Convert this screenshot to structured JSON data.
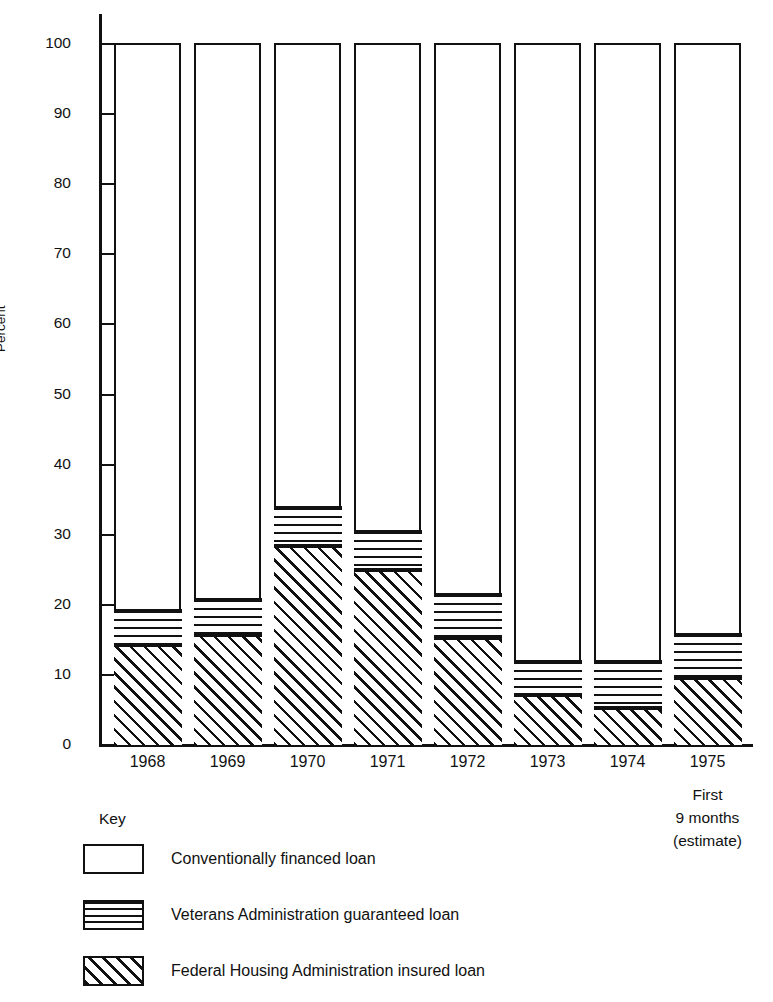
{
  "chart_data": {
    "type": "bar",
    "subtype": "stacked-percent",
    "title": "",
    "xlabel": "",
    "ylabel": "Percent",
    "ylim": [
      0,
      100
    ],
    "ytick_step": 10,
    "yticks": [
      100,
      90,
      80,
      70,
      60,
      50,
      40,
      30,
      20,
      10,
      0
    ],
    "grid": false,
    "legend_position": "below-left",
    "legend_title": "Key",
    "categories": [
      "1968",
      "1969",
      "1970",
      "1971",
      "1972",
      "1973",
      "1974",
      "1975"
    ],
    "category_notes": {
      "1975": [
        "First",
        "9 months",
        "(estimate)"
      ]
    },
    "series": [
      {
        "name": "Federal Housing Administration insured loan",
        "pattern": "diagonal-hatch",
        "values": [
          13.8,
          15.3,
          28.0,
          24.6,
          14.8,
          6.7,
          4.9,
          9.1
        ]
      },
      {
        "name": "Veterans Administration guaranteed loan",
        "pattern": "horizontal-lines",
        "values": [
          5.2,
          5.2,
          5.7,
          5.7,
          6.5,
          5.0,
          6.8,
          6.5
        ]
      },
      {
        "name": "Conventionally financed loan",
        "pattern": "white",
        "values": [
          81.0,
          79.5,
          66.3,
          69.7,
          78.7,
          88.3,
          88.3,
          84.4
        ]
      }
    ],
    "cumulative_tops": {
      "fha": [
        13.8,
        15.3,
        28.0,
        24.6,
        14.8,
        6.7,
        4.9,
        9.1
      ],
      "va": [
        19.0,
        20.5,
        33.7,
        30.3,
        21.3,
        11.7,
        11.7,
        15.6
      ],
      "conventional": [
        100,
        100,
        100,
        100,
        100,
        100,
        100,
        100
      ]
    },
    "legend_entries": [
      {
        "label": "Conventionally financed loan",
        "pattern": "white"
      },
      {
        "label": "Veterans Administration guaranteed loan",
        "pattern": "horizontal-lines"
      },
      {
        "label": "Federal Housing Administration insured loan",
        "pattern": "diagonal-hatch"
      }
    ],
    "colors": {
      "ink": "#111111",
      "background": "#ffffff"
    }
  }
}
